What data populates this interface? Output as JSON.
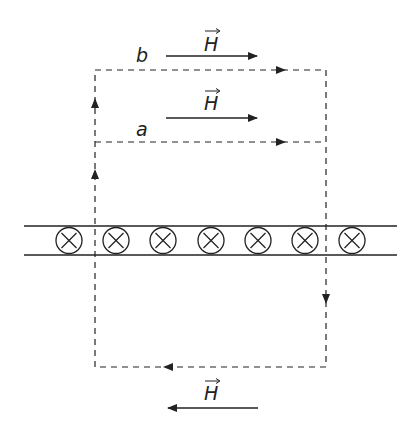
{
  "diagram": {
    "colors": {
      "stroke": "#222222",
      "background": "#ffffff"
    },
    "loop_labels": {
      "b": "b",
      "a": "a"
    },
    "field_label": "H",
    "field_arrows": [
      {
        "id": "field-above-b",
        "label": "H",
        "direction": "right"
      },
      {
        "id": "field-above-a",
        "label": "H",
        "direction": "right"
      },
      {
        "id": "field-below",
        "label": "H",
        "direction": "left"
      }
    ],
    "current_sheet": {
      "symbol": "into-page (⊗)",
      "count": 7
    },
    "loops": [
      {
        "name": "b",
        "circulation": "counterclockwise-from-top-left: up left side, right along top, down right side, left along bottom"
      },
      {
        "name": "a",
        "circulation": "shares lower part; top edge runs right"
      }
    ]
  }
}
